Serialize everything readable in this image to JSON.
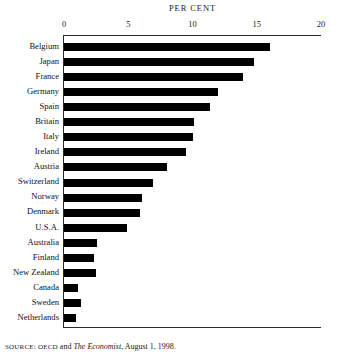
{
  "chart_data": {
    "type": "bar",
    "orientation": "horizontal",
    "title": "PER CENT",
    "xlabel": "PER CENT",
    "ylabel": "",
    "xlim": [
      0,
      20
    ],
    "xticks": [
      0,
      5,
      10,
      15,
      20
    ],
    "xtick_labels": [
      "0",
      "5",
      "10",
      "15",
      "20"
    ],
    "grid": false,
    "legend": null,
    "bar_color": "#000000",
    "categories": [
      "Belgium",
      "Japan",
      "France",
      "Germany",
      "Spain",
      "Britain",
      "Italy",
      "Ireland",
      "Austria",
      "Switzerland",
      "Norway",
      "Denmark",
      "U.S.A.",
      "Australia",
      "Finland",
      "New Zealand",
      "Canada",
      "Sweden",
      "Netherlands"
    ],
    "values": [
      16.0,
      14.8,
      13.9,
      12.0,
      11.4,
      10.1,
      10.0,
      9.5,
      8.0,
      6.9,
      6.1,
      5.9,
      4.9,
      2.6,
      2.3,
      2.5,
      1.1,
      1.3,
      0.9
    ]
  },
  "source": {
    "prefix": "SOURCE:",
    "org": "OECD",
    "conjunction": "and",
    "publication": "The Economist",
    "date": ", August 1, 1998."
  }
}
